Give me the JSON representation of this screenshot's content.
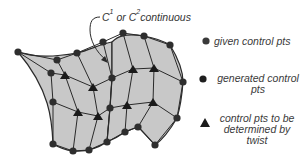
{
  "annotation": {
    "c": "C",
    "sup1": "1",
    "or": " or ",
    "c2": "C",
    "sup2": "2",
    "rest": "continuous"
  },
  "legend": {
    "items": [
      {
        "symbol": "circle",
        "color": "#3a3a3a",
        "label": "given control pts"
      },
      {
        "symbol": "circle",
        "color": "#1e1e1e",
        "label_line1": "generated control",
        "label_line2": "pts"
      },
      {
        "symbol": "triangle",
        "color": "#1a1a1a",
        "label_line1": "control pts to be",
        "label_line2": "determined by",
        "label_line3": "twist"
      }
    ]
  },
  "colors": {
    "patch_fill": "#c8c8c8",
    "mesh_line": "#2a2a2a",
    "point": "#2e2e2e"
  }
}
